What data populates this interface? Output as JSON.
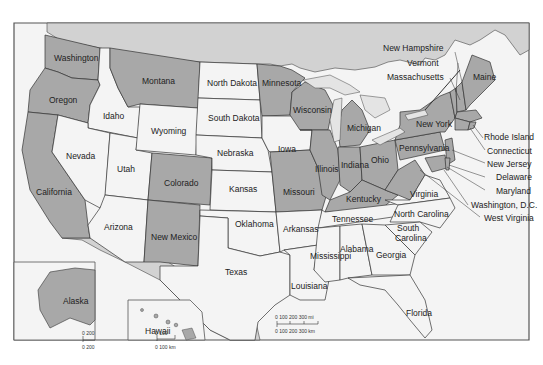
{
  "map": {
    "title": "United States",
    "colors": {
      "dark_state": "#a8a8a8",
      "light_state": "#f4f4f4",
      "water": "#e4e4e4",
      "foreign": "#d2d2d2",
      "border": "#333333",
      "frame": "#555555"
    },
    "states": {
      "washington": "Washington",
      "oregon": "Oregon",
      "california": "California",
      "idaho": "Idaho",
      "nevada": "Nevada",
      "utah": "Utah",
      "arizona": "Arizona",
      "montana": "Montana",
      "wyoming": "Wyoming",
      "colorado": "Colorado",
      "new_mexico": "New Mexico",
      "north_dakota": "North Dakota",
      "south_dakota": "South Dakota",
      "nebraska": "Nebraska",
      "kansas": "Kansas",
      "oklahoma": "Oklahoma",
      "texas": "Texas",
      "minnesota": "Minnesota",
      "iowa": "Iowa",
      "missouri": "Missouri",
      "arkansas": "Arkansas",
      "louisiana": "Louisiana",
      "wisconsin": "Wisconsin",
      "illinois": "Illinois",
      "michigan": "Michigan",
      "indiana": "Indiana",
      "ohio": "Ohio",
      "kentucky": "Kentucky",
      "tennessee": "Tennessee",
      "mississippi": "Mississippi",
      "alabama": "Alabama",
      "georgia": "Georgia",
      "florida": "Florida",
      "south_carolina_1": "South",
      "south_carolina_2": "Carolina",
      "north_carolina": "North Carolina",
      "virginia": "Virginia",
      "pennsylvania": "Pennsylvania",
      "new_york": "New York",
      "maine": "Maine",
      "new_hampshire": "New Hampshire",
      "vermont": "Vermont",
      "massachusetts": "Massachusetts",
      "rhode_island": "Rhode Island",
      "connecticut": "Connecticut",
      "new_jersey": "New Jersey",
      "delaware": "Delaware",
      "maryland": "Maryland",
      "washington_dc": "Washington, D.C.",
      "west_virginia": "West Virginia",
      "alaska": "Alaska",
      "hawaii": "Hawaii"
    },
    "scale_main": {
      "mi": "0   100   200   300 mi",
      "km": "0  100 200 300 km"
    },
    "scale_alaska": {
      "mi": "0   200",
      "km": "0  200"
    },
    "scale_hawaii": {
      "mi": "0   100",
      "km": "0  100 km"
    }
  }
}
